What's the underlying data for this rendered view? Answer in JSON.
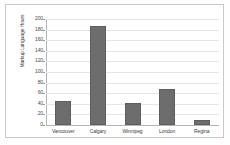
{
  "chart_data": {
    "type": "bar",
    "title": "",
    "subtitle": "",
    "xlabel": "",
    "ylabel": "Markup Language Hours",
    "categories": [
      "Vancouver",
      "Calgary",
      "Winnipeg",
      "London",
      "Regina"
    ],
    "values": [
      45,
      187,
      42,
      68,
      10
    ],
    "ylim": [
      0,
      200
    ],
    "yticks": [
      0,
      20,
      40,
      60,
      80,
      100,
      120,
      140,
      160,
      180,
      200
    ],
    "ytick_labels": [
      "0",
      "20",
      "40",
      "60",
      "80",
      "100",
      "120",
      "140",
      "160",
      "180",
      "200"
    ],
    "grid": true,
    "legend": null,
    "series": [
      {
        "name": "Markup Language Hours",
        "values": [
          45,
          187,
          42,
          68,
          10
        ]
      }
    ],
    "colors": {
      "bar": "#6d6d6d",
      "bar_border": "#5e5e5e",
      "gridline": "#e6e6e6",
      "axis": "#b4b4b4",
      "frame": "#c8c8c8",
      "background": "#ffffff",
      "text": "#3c3c3c"
    }
  }
}
